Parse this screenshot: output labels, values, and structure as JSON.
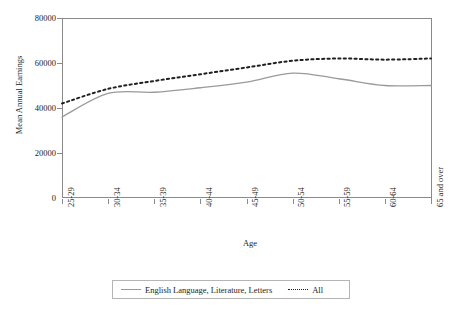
{
  "chart_data": {
    "type": "line",
    "title": "",
    "xlabel": "Age",
    "ylabel": "Mean Annual Earnings",
    "categories": [
      "25-29",
      "30-34",
      "35-39",
      "40-44",
      "45-49",
      "50-54",
      "55-59",
      "60-64",
      "65 and over"
    ],
    "ylim": [
      0,
      80000
    ],
    "yticks": [
      0,
      20000,
      40000,
      60000,
      80000
    ],
    "ytick_labels": [
      "0",
      "20000",
      "40000",
      "60000",
      "80000"
    ],
    "grid": false,
    "legend_position": "bottom",
    "series": [
      {
        "name": "English Language, Literature, Letters",
        "style": "solid",
        "color": "#9a9a9a",
        "values": [
          36000,
          46500,
          47000,
          49000,
          51500,
          55500,
          53000,
          50000,
          50000
        ]
      },
      {
        "name": "All",
        "style": "dotted",
        "color": "#202020",
        "values": [
          42000,
          48500,
          52000,
          55000,
          58000,
          61000,
          62000,
          61500,
          62000
        ]
      }
    ]
  },
  "legend": {
    "entries": [
      {
        "label": "English Language, Literature, Letters"
      },
      {
        "label": "All"
      }
    ]
  }
}
